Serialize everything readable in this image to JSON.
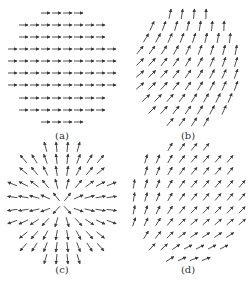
{
  "figure": {
    "width": 249,
    "height": 285,
    "arrow_color": "#3a3a3a",
    "panels": [
      {
        "id": "a",
        "label": "(a)",
        "label_pos": [
          62,
          137
        ],
        "field": "uniform",
        "center": [
          62,
          68
        ],
        "angle_deg": 0,
        "arrow_length": 9,
        "spacing_x": 11,
        "rows": [
          {
            "y": 13,
            "count": 4
          },
          {
            "y": 25,
            "count": 8
          },
          {
            "y": 37,
            "count": 8
          },
          {
            "y": 49,
            "count": 10
          },
          {
            "y": 61,
            "count": 10
          },
          {
            "y": 73,
            "count": 10
          },
          {
            "y": 85,
            "count": 10
          },
          {
            "y": 98,
            "count": 8
          },
          {
            "y": 110,
            "count": 8
          },
          {
            "y": 122,
            "count": 4
          }
        ]
      },
      {
        "id": "b",
        "label": "(b)",
        "label_pos": [
          188,
          137
        ],
        "field": "skew-uniform",
        "center": [
          188,
          70
        ],
        "angle_deg": -55,
        "arrow_length": 10,
        "spacing_x": 12,
        "rows": [
          {
            "y": 14,
            "count": 4
          },
          {
            "y": 26,
            "count": 7
          },
          {
            "y": 38,
            "count": 8
          },
          {
            "y": 50,
            "count": 9
          },
          {
            "y": 62,
            "count": 9
          },
          {
            "y": 74,
            "count": 9
          },
          {
            "y": 86,
            "count": 9
          },
          {
            "y": 98,
            "count": 8
          },
          {
            "y": 110,
            "count": 7
          },
          {
            "y": 122,
            "count": 4
          }
        ]
      },
      {
        "id": "c",
        "label": "(c)",
        "label_pos": [
          62,
          271
        ],
        "field": "radial-source",
        "center": [
          62,
          204
        ],
        "angle_deg": 0,
        "arrow_length": 10,
        "spacing_x": 11,
        "rows": [
          {
            "y": 147,
            "count": 4
          },
          {
            "y": 159,
            "count": 8
          },
          {
            "y": 171,
            "count": 8
          },
          {
            "y": 184,
            "count": 10
          },
          {
            "y": 197,
            "count": 10
          },
          {
            "y": 210,
            "count": 10
          },
          {
            "y": 222,
            "count": 10
          },
          {
            "y": 235,
            "count": 8
          },
          {
            "y": 247,
            "count": 8
          },
          {
            "y": 259,
            "count": 4
          }
        ]
      },
      {
        "id": "d",
        "label": "(d)",
        "label_pos": [
          188,
          271
        ],
        "field": "swirl-corner",
        "center": [
          188,
          204
        ],
        "angle_deg": -50,
        "arrow_length": 9,
        "spacing_x": 12,
        "rows": [
          {
            "y": 147,
            "count": 4
          },
          {
            "y": 159,
            "count": 8
          },
          {
            "y": 171,
            "count": 8
          },
          {
            "y": 184,
            "count": 10
          },
          {
            "y": 197,
            "count": 10
          },
          {
            "y": 210,
            "count": 10
          },
          {
            "y": 222,
            "count": 10
          },
          {
            "y": 235,
            "count": 8
          },
          {
            "y": 247,
            "count": 7
          },
          {
            "y": 259,
            "count": 4
          }
        ]
      }
    ]
  }
}
